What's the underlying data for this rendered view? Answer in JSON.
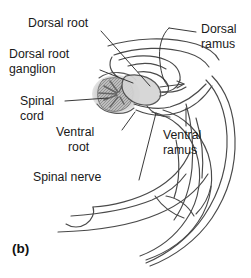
{
  "figure": {
    "caption": "(b)",
    "type": "anatomical-diagram",
    "colors": {
      "stroke": "#4a4a4a",
      "stroke_dark": "#2e2e2e",
      "text": "#1a1a1a",
      "background": "#ffffff",
      "cord_fill": "#b4b4b4",
      "ganglion_fill": "#cfcfcf"
    },
    "labels": [
      {
        "id": "dorsal-root",
        "text": "Dorsal root",
        "lines": [
          "Dorsal root"
        ]
      },
      {
        "id": "dorsal-root-ganglion",
        "text": "Dorsal root ganglion",
        "lines": [
          "Dorsal root",
          "ganglion"
        ]
      },
      {
        "id": "spinal-cord",
        "text": "Spinal cord",
        "lines": [
          "Spinal",
          "cord"
        ]
      },
      {
        "id": "ventral-root",
        "text": "Ventral root",
        "lines": [
          "Ventral",
          "root"
        ]
      },
      {
        "id": "spinal-nerve",
        "text": "Spinal nerve",
        "lines": [
          "Spinal nerve"
        ]
      },
      {
        "id": "dorsal-ramus",
        "text": "Dorsal ramus",
        "lines": [
          "Dorsal",
          "ramus"
        ]
      },
      {
        "id": "ventral-ramus",
        "text": "Ventral ramus",
        "lines": [
          "Ventral",
          "ramus"
        ]
      }
    ],
    "label_text": {
      "dorsal_root": "Dorsal root",
      "dorsal_root_ganglion_l1": "Dorsal root",
      "dorsal_root_ganglion_l2": "ganglion",
      "spinal_cord_l1": "Spinal",
      "spinal_cord_l2": "cord",
      "ventral_root_l1": "Ventral",
      "ventral_root_l2": "root",
      "spinal_nerve": "Spinal nerve",
      "dorsal_ramus_l1": "Dorsal",
      "dorsal_ramus_l2": "ramus",
      "ventral_ramus_l1": "Ventral",
      "ventral_ramus_l2": "ramus"
    }
  }
}
